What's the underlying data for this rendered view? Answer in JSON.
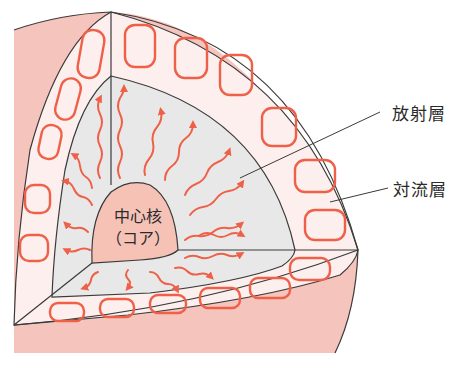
{
  "labels": {
    "radiative_zone": "放射層",
    "convective_zone": "対流層",
    "core_line1": "中心核",
    "core_line2": "（コア）"
  },
  "colors": {
    "sphere_surface": "#f5c4bd",
    "convective_zone_fill": "#fcefed",
    "radiative_zone_fill": "#e9e8e8",
    "core_fill": "#f6c2b6",
    "arrow_color": "#ee6148",
    "outline": "#3a3a3a",
    "label_text": "#2a2a2a"
  },
  "diagram_parts": [
    {
      "id": "core",
      "name": "中心核（コア）",
      "energy_transport": "radiation arrows emanate outward"
    },
    {
      "id": "radiative_zone",
      "name": "放射層",
      "arrow_type": "wavy outward arrows"
    },
    {
      "id": "convective_zone",
      "name": "対流層",
      "arrow_type": "circulating loop arrows"
    }
  ]
}
